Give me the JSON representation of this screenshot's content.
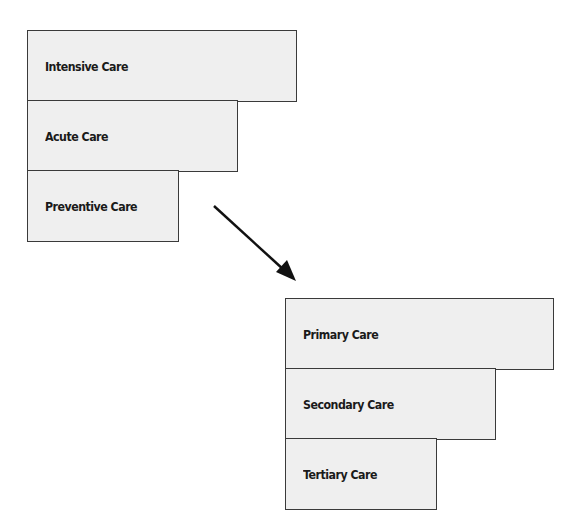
{
  "diagram": {
    "top_group": {
      "boxes": [
        {
          "label": "Intensive Care"
        },
        {
          "label": "Acute Care"
        },
        {
          "label": "Preventive Care"
        }
      ]
    },
    "arrow": {
      "direction": "down-right"
    },
    "bottom_group": {
      "boxes": [
        {
          "label": "Primary Care"
        },
        {
          "label": "Secondary Care"
        },
        {
          "label": "Tertiary Care"
        }
      ]
    },
    "colors": {
      "box_fill": "#efefef",
      "border": "#3a3a3a",
      "text": "#1a1a1a",
      "arrow": "#111111"
    }
  }
}
